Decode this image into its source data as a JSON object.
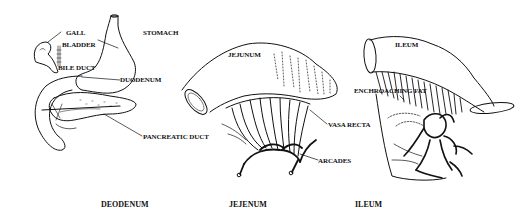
{
  "figure": {
    "panels": [
      {
        "id": "duodenum",
        "caption": "DEODENUM",
        "labels": {
          "gall": "GALL",
          "bladder": "BLADDER",
          "bile_duct": "BILE DUCT",
          "stomach": "STOMACH",
          "duodenum": "DUODENUM",
          "pancreatic_duct": "PANCREATIC DUCT"
        }
      },
      {
        "id": "jejunum",
        "caption": "JEJENUM",
        "labels": {
          "jejunum": "JEJUNUM",
          "vasa_recta": "VASA RECTA",
          "arcades": "ARCADES"
        }
      },
      {
        "id": "ileum",
        "caption": "ILEUM",
        "labels": {
          "ileum": "ILEUM",
          "encroaching_fat": "ENCHROACHING FAT"
        }
      }
    ],
    "colors": {
      "ink": "#111111",
      "background": "#ffffff"
    }
  }
}
